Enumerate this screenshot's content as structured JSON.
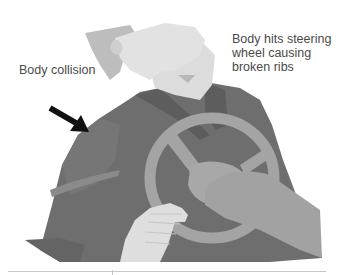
{
  "figure": {
    "style": "grayscale illustration",
    "colors": {
      "background": "#ffffff",
      "shirt": "#6e6e6e",
      "shirt_shadow": "#5a5a5a",
      "skin": "#d8d8d8",
      "skin_light": "#e6e6e6",
      "hair": "#bcbcbc",
      "steering_wheel": "#a4a4a4",
      "arrow": "#111111",
      "label_text": "#4a4a4a",
      "rule": "#c8c8c8"
    }
  },
  "labels": {
    "collision": "Body collision",
    "steering": "Body hits steering\nwheel causing\nbroken ribs"
  },
  "annotations": {
    "arrow": "impact-direction-arrow"
  }
}
